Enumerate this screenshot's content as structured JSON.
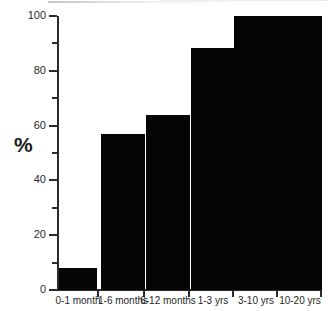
{
  "chart_data": {
    "type": "bar",
    "title": "",
    "xlabel": "",
    "ylabel": "%",
    "categories": [
      "0-1 month",
      "1-6 months",
      "6-12 months",
      "1-3 yrs",
      "3-10 yrs",
      "10-20 yrs"
    ],
    "values": [
      8,
      57,
      64,
      88.5,
      100,
      100
    ],
    "ylim": [
      0,
      100
    ],
    "y_major_ticks": [
      0,
      20,
      40,
      60,
      80,
      100
    ],
    "y_minor_ticks": [
      10,
      30,
      50,
      70,
      90
    ],
    "y_tick_labels": [
      "0",
      "20",
      "40",
      "60",
      "80",
      "100"
    ],
    "grid": false,
    "legend": false,
    "bar_color": "#050505",
    "axis_color": "#2b2b2b"
  }
}
